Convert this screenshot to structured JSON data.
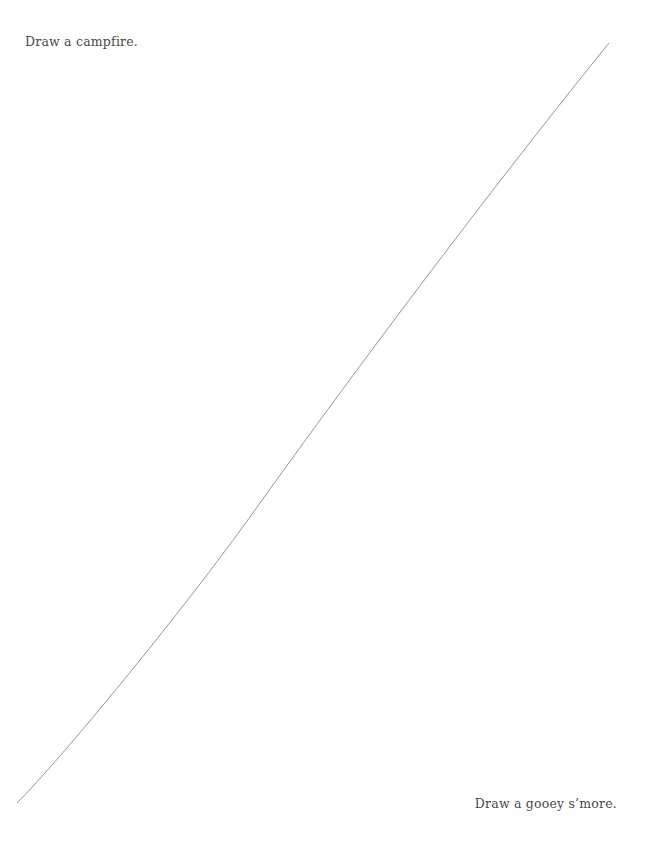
{
  "page": {
    "prompt_top": "Draw a campfire.",
    "prompt_bottom": "Draw a gooey s’more.",
    "divider": {
      "start": [
        609,
        43
      ],
      "end": [
        17,
        803
      ],
      "color": "#8a8a8a"
    }
  }
}
